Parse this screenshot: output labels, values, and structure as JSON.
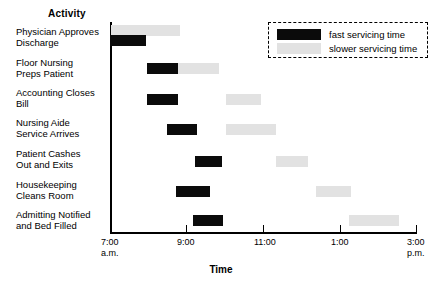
{
  "header": {
    "activity_column_label": "Activity"
  },
  "legend": {
    "fast_label": "fast servicing time",
    "slow_label": "slower servicing time",
    "fast_color": "#0b0b0b",
    "slow_color": "#e2e2e2"
  },
  "axis": {
    "x_title": "Time",
    "ticks": [
      {
        "label": "7:00",
        "sub": "a.m.",
        "x": 110
      },
      {
        "label": "9:00",
        "sub": "",
        "x": 186
      },
      {
        "label": "11:00",
        "sub": "",
        "x": 263
      },
      {
        "label": "1:00",
        "sub": "",
        "x": 340
      },
      {
        "label": "3:00",
        "sub": "p.m.",
        "x": 416
      }
    ]
  },
  "chart_data": {
    "type": "bar",
    "title": "",
    "xlabel": "Time",
    "ylabel": "Activity",
    "orientation": "horizontal",
    "xlim": [
      "7:00 a.m.",
      "3:00 p.m."
    ],
    "xtick_labels": [
      "7:00 a.m.",
      "9:00",
      "11:00",
      "1:00",
      "3:00 p.m."
    ],
    "grid": false,
    "legend_position": "top-right",
    "series": [
      {
        "name": "fast servicing time",
        "color": "#0b0b0b"
      },
      {
        "name": "slower servicing time",
        "color": "#e2e2e2"
      }
    ],
    "categories": [
      "Physician Approves\nDischarge",
      "Floor Nursing\nPreps Patient",
      "Accounting Closes\nBill",
      "Nursing Aide\nService Arrives",
      "Patient Cashes\nOut and Exits",
      "Housekeeping\nCleans Room",
      "Admitting Notified\nand Bed Filled"
    ],
    "rows": [
      {
        "activity": "Physician Approves\nDischarge",
        "fast": {
          "start": "7:00",
          "end": "7:57"
        },
        "slow": {
          "start": "7:00",
          "end": "8:50"
        }
      },
      {
        "activity": "Floor Nursing\nPreps Patient",
        "fast": {
          "start": "7:58",
          "end": "8:47"
        },
        "slow": {
          "start": "8:47",
          "end": "9:50"
        }
      },
      {
        "activity": "Accounting Closes\nBill",
        "fast": {
          "start": "7:58",
          "end": "8:47"
        },
        "slow": {
          "start": "10:01",
          "end": "10:56"
        }
      },
      {
        "activity": "Nursing Aide\nService Arrives",
        "fast": {
          "start": "8:30",
          "end": "9:17"
        },
        "slow": {
          "start": "10:01",
          "end": "11:20"
        }
      },
      {
        "activity": "Patient Cashes\nOut and Exits",
        "fast": {
          "start": "9:14",
          "end": "9:57"
        },
        "slow": {
          "start": "11:20",
          "end": "12:10"
        }
      },
      {
        "activity": "Housekeeping\nCleans Room",
        "fast": {
          "start": "8:44",
          "end": "9:34"
        },
        "slow": {
          "start": "12:23",
          "end": "1:18"
        }
      },
      {
        "activity": "Admitting Notified\nand Bed Filled",
        "fast": {
          "start": "9:07",
          "end": "9:54"
        },
        "slow": {
          "start": "1:18",
          "end": "2:37"
        }
      }
    ]
  },
  "geometry": {
    "rows": [
      {
        "label_top": 27,
        "slow_top": 25,
        "slow_left": 111,
        "slow_width": 69,
        "fast_top": 35,
        "fast_left": 110,
        "fast_width": 36
      },
      {
        "label_top": 58,
        "slow_top": 63,
        "slow_left": 178,
        "slow_width": 41,
        "fast_top": 63,
        "fast_left": 147,
        "fast_width": 31
      },
      {
        "label_top": 88,
        "slow_top": 94,
        "slow_left": 226,
        "slow_width": 35,
        "fast_top": 94,
        "fast_left": 147,
        "fast_width": 31
      },
      {
        "label_top": 118,
        "slow_top": 124,
        "slow_left": 226,
        "slow_width": 50,
        "fast_top": 124,
        "fast_left": 167,
        "fast_width": 30
      },
      {
        "label_top": 149,
        "slow_top": 156,
        "slow_left": 276,
        "slow_width": 32,
        "fast_top": 156,
        "fast_left": 195,
        "fast_width": 27
      },
      {
        "label_top": 180,
        "slow_top": 186,
        "slow_left": 316,
        "slow_width": 35,
        "fast_top": 186,
        "fast_left": 176,
        "fast_width": 34
      },
      {
        "label_top": 210,
        "slow_top": 215,
        "slow_left": 349,
        "slow_width": 50,
        "fast_top": 215,
        "fast_left": 193,
        "fast_width": 30
      }
    ]
  }
}
